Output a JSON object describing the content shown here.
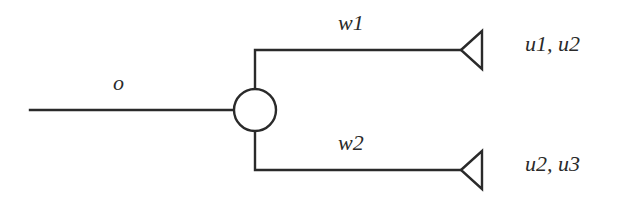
{
  "diagram": {
    "type": "multicast-tree",
    "stroke_color": "#2a2a2a",
    "background": "#ffffff",
    "source_link": {
      "label": "o"
    },
    "branch_node": {
      "shape": "circle"
    },
    "branches": [
      {
        "link_label": "w1",
        "receivers_label": "u1, u2",
        "terminal_shape": "triangle"
      },
      {
        "link_label": "w2",
        "receivers_label": "u2, u3",
        "terminal_shape": "triangle"
      }
    ]
  }
}
